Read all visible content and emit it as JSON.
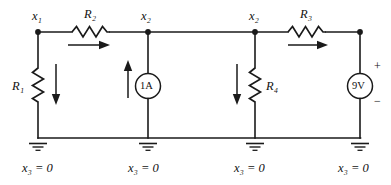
{
  "diagram": {
    "type": "electrical-circuit-schematic",
    "ink_color": "#1a1a1a",
    "background_color": "#ffffff"
  },
  "node_labels": [
    {
      "id": "node-x1",
      "text": "x₁",
      "base": "x",
      "subscript": "1",
      "x": 32,
      "y": 10
    },
    {
      "id": "node-x2-left",
      "text": "x₂",
      "base": "x",
      "subscript": "2",
      "x": 141,
      "y": 10
    },
    {
      "id": "node-x2-right",
      "text": "x₂",
      "base": "x",
      "subscript": "2",
      "x": 249,
      "y": 10
    },
    {
      "id": "node-x3-ground-1",
      "text": "x₃ = 0",
      "base": "x",
      "subscript": "3",
      "value": "0",
      "x": 22,
      "y": 163
    },
    {
      "id": "node-x3-ground-2",
      "text": "x₃ = 0",
      "base": "x",
      "subscript": "3",
      "value": "0",
      "x": 128,
      "y": 163
    },
    {
      "id": "node-x3-ground-3",
      "text": "x₃ = 0",
      "base": "x",
      "subscript": "3",
      "value": "0",
      "x": 232,
      "y": 163
    },
    {
      "id": "node-x3-ground-4",
      "text": "x₃ = 0",
      "base": "x",
      "subscript": "3",
      "value": "0",
      "x": 336,
      "y": 163
    }
  ],
  "components": [
    {
      "id": "resistor-r1",
      "kind": "resistor",
      "label": "R₁",
      "base": "R",
      "subscript": "1",
      "orientation": "vertical",
      "label_x": 12,
      "label_y": 80,
      "current_arrow": "down"
    },
    {
      "id": "resistor-r2",
      "kind": "resistor",
      "label": "R₂",
      "base": "R",
      "subscript": "2",
      "orientation": "horizontal",
      "label_x": 84,
      "label_y": 8,
      "current_arrow": "right"
    },
    {
      "id": "resistor-r3",
      "kind": "resistor",
      "label": "R₃",
      "base": "R",
      "subscript": "3",
      "orientation": "horizontal",
      "label_x": 300,
      "label_y": 8,
      "current_arrow": "right"
    },
    {
      "id": "resistor-r4",
      "kind": "resistor",
      "label": "R₄",
      "base": "R",
      "subscript": "4",
      "orientation": "vertical",
      "label_x": 266,
      "label_y": 80,
      "current_arrow": "down"
    },
    {
      "id": "current-source-1a",
      "kind": "current-source",
      "label": "1A",
      "value": "1",
      "unit": "A",
      "center_x": 148,
      "center_y": 86,
      "radius": 12.5,
      "current_arrow": "up"
    },
    {
      "id": "voltage-source-9v",
      "kind": "voltage-source",
      "label": "9V",
      "value": "9",
      "unit": "V",
      "center_x": 360,
      "center_y": 86,
      "radius": 12.5,
      "plus_sign": "+",
      "minus_sign": "−",
      "plus_x": 374,
      "plus_y": 66,
      "minus_x": 374,
      "minus_y": 97
    }
  ],
  "rails": {
    "top_y": 32,
    "bottom_y": 138,
    "left_x": 38,
    "right_x": 360
  },
  "ground_symbols": [
    {
      "id": "ground-1",
      "x": 38,
      "y": 138
    },
    {
      "id": "ground-2",
      "x": 148,
      "y": 138
    },
    {
      "id": "ground-3",
      "x": 255,
      "y": 138
    },
    {
      "id": "ground-4",
      "x": 360,
      "y": 138
    }
  ]
}
